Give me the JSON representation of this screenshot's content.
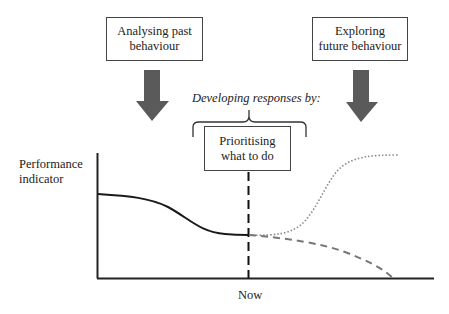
{
  "diagram": {
    "boxes": {
      "past": {
        "line1": "Analysing past",
        "line2": "behaviour"
      },
      "future": {
        "line1": "Exploring",
        "line2": "future behaviour"
      },
      "prioritise": {
        "line1": "Prioritising",
        "line2": "what to do"
      }
    },
    "caption": "Developing responses by:",
    "y_axis_label": {
      "line1": "Performance",
      "line2": "indicator"
    },
    "x_marker_label": "Now",
    "colors": {
      "arrow": "#5a5a5a",
      "line_past": "#1a1a1a",
      "line_improve": "#888888",
      "line_decline": "#777777",
      "axis": "#222222"
    },
    "series": [
      {
        "name": "past-performance",
        "style": "solid"
      },
      {
        "name": "improved-future-performance",
        "style": "dotted"
      },
      {
        "name": "declining-future-performance",
        "style": "dashed"
      }
    ]
  }
}
